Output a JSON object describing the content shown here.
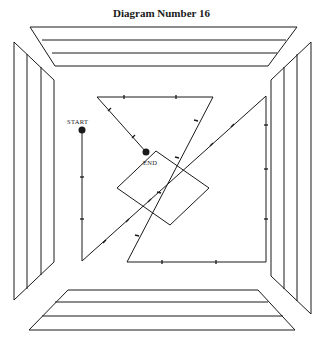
{
  "title": "Diagram Number 16",
  "labels": {
    "start": "START",
    "end": "END"
  },
  "colors": {
    "ink": "#1a1a1a",
    "background": "#ffffff"
  },
  "frame": {
    "description": "Four trapezoidal wall panels forming a room frame, each with 3 stripes",
    "panels": [
      "top",
      "bottom",
      "left",
      "right"
    ],
    "stripes_per_panel": 3
  },
  "path": {
    "start": [
      82,
      130
    ],
    "end": [
      146,
      152
    ],
    "points": [
      [
        82,
        130
      ],
      [
        82,
        261
      ],
      [
        266,
        96
      ],
      [
        266,
        262
      ],
      [
        127,
        262
      ],
      [
        213,
        97
      ],
      [
        97,
        97
      ],
      [
        146,
        152
      ]
    ]
  },
  "square": {
    "points": [
      [
        156,
        151
      ],
      [
        209,
        188
      ],
      [
        170,
        225
      ],
      [
        117,
        188
      ]
    ]
  }
}
